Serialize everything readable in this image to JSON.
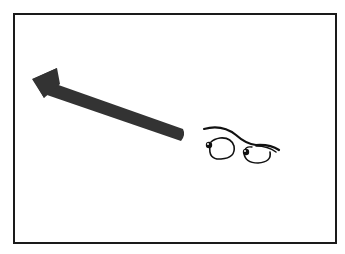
{
  "illustration": {
    "description": "Framed cartoon: a thick dark arrow pointing up-left with a pair of cartoon eyes looking toward it",
    "colors": {
      "background": "#ffffff",
      "frame": "#1a1a1a",
      "arrow": "#333333",
      "eyes": "#111111"
    },
    "icons": [
      "arrow-up-left-icon",
      "cartoon-eyes-icon"
    ]
  }
}
